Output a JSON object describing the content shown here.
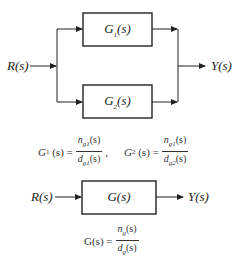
{
  "parallel_diagram": {
    "input_label": "R(s)",
    "output_label": "Y(s)",
    "blocks": [
      {
        "label_main": "G",
        "label_sub": "1",
        "label_arg": "(s)"
      },
      {
        "label_main": "G",
        "label_sub": "2",
        "label_arg": "(s)"
      }
    ],
    "formulas": [
      {
        "lhs_main": "G",
        "lhs_sub": "1",
        "lhs_arg": "(s) =",
        "num": "n",
        "num_sub": "g1",
        "num_arg": "(s)",
        "den": "d",
        "den_sub": "g1",
        "den_arg": "(s)",
        "sep": ","
      },
      {
        "lhs_main": "G",
        "lhs_sub": "2",
        "lhs_arg": "(s) =",
        "num": "n",
        "num_sub": "g1",
        "num_arg": "(s)",
        "den": "d",
        "den_sub": "g2",
        "den_arg": "(s)"
      }
    ]
  },
  "equivalent_diagram": {
    "input_label": "R(s)",
    "output_label": "Y(s)",
    "block_label": "G(s)",
    "formula": {
      "lhs": "G(s) =",
      "num": "n",
      "num_sub": "g",
      "num_arg": "(s)",
      "den": "d",
      "den_sub": "g",
      "den_arg": "(s)"
    }
  },
  "colors": {
    "line": "#222222",
    "background": "#ffffff"
  }
}
